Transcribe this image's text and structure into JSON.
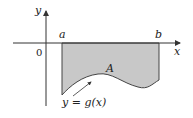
{
  "diagram": {
    "axes": {
      "x_label": "x",
      "y_label": "y",
      "origin_label": "0"
    },
    "bounds": {
      "left_label": "a",
      "right_label": "b"
    },
    "region": {
      "label": "A",
      "fill_color": "#c8c8c8"
    },
    "curve": {
      "label": "y = g(x)"
    },
    "colors": {
      "axis": "#333333",
      "outline": "#444444",
      "text": "#222222"
    }
  }
}
